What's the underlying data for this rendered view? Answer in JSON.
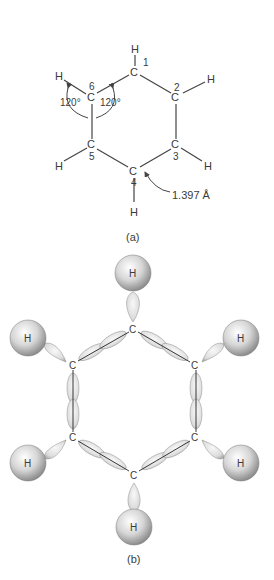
{
  "figure_a": {
    "caption": "(a)",
    "atoms": {
      "c1": "C",
      "c2": "C",
      "c3": "C",
      "c4": "C",
      "c5": "C",
      "c6": "C",
      "h1": "H",
      "h2": "H",
      "h3": "H",
      "h4": "H",
      "h5": "H",
      "h6": "H"
    },
    "numbers": {
      "n1": "1",
      "n2": "2",
      "n3": "3",
      "n4": "4",
      "n5": "5",
      "n6": "6"
    },
    "angle_left": "120°",
    "angle_right": "120°",
    "bond_length": "1.397 Å"
  },
  "figure_b": {
    "caption": "(b)",
    "carbons": {
      "top": "C",
      "upper_left": "C",
      "upper_right": "C",
      "lower_left": "C",
      "lower_right": "C",
      "bottom": "C"
    },
    "hydrogens": {
      "top": "H",
      "upper_left": "H",
      "upper_right": "H",
      "lower_left": "H",
      "lower_right": "H",
      "bottom": "H"
    }
  }
}
